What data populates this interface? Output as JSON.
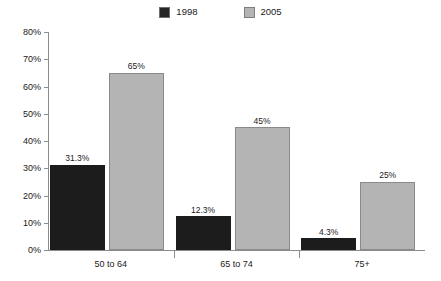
{
  "chart_data": {
    "type": "bar",
    "title": "",
    "subtitle": "",
    "xlabel": "",
    "ylabel": "",
    "categories": [
      "50 to 64",
      "65 to 74",
      "75+"
    ],
    "series": [
      {
        "name": "1998",
        "color": "#1c1c1c",
        "values": [
          31.3,
          12.3,
          4.3
        ],
        "labels": [
          "31.3%",
          "12.3%",
          "4.3%"
        ]
      },
      {
        "name": "2005",
        "color": "#b4b4b4",
        "values": [
          65,
          45,
          25
        ],
        "labels": [
          "65%",
          "45%",
          "25%"
        ]
      }
    ],
    "ylim": [
      0,
      80
    ],
    "yticks": [
      0,
      10,
      20,
      30,
      40,
      50,
      60,
      70,
      80
    ],
    "ytick_labels": [
      "0%",
      "10%",
      "20%",
      "30%",
      "40%",
      "50%",
      "60%",
      "70%",
      "80%"
    ],
    "grid": false,
    "legend_position": "top-center"
  },
  "legend": {
    "entries": [
      {
        "label": "1998",
        "swatch": "legend-swatch-1998"
      },
      {
        "label": "2005",
        "swatch": "legend-swatch-2005"
      }
    ]
  },
  "axes": {
    "y_labels": [
      "80%",
      "70%",
      "60%",
      "50%",
      "40%",
      "30%",
      "20%",
      "10%",
      "0%"
    ],
    "x_labels": [
      "50 to 64",
      "65 to 74",
      "75+"
    ]
  }
}
